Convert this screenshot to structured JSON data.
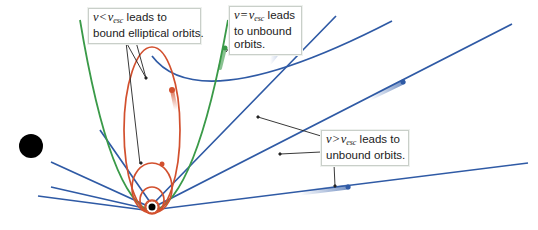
{
  "colors": {
    "ellipse": "#d2502e",
    "parabola": "#3a9a48",
    "hyperbola": "#2f5aa5",
    "planet": "#000000",
    "leader_line": "#222222",
    "callout_border": "#c9cfc9"
  },
  "callouts": {
    "bound": {
      "v": "v",
      "op": "<",
      "vsub_base": "v",
      "vsub": "esc",
      "text_line1_suffix": " leads to",
      "text_line2": "bound elliptical orbits."
    },
    "parabolic": {
      "v": "v",
      "op": "=",
      "vsub_base": "v",
      "vsub": "esc",
      "text_line1_suffix": " leads",
      "text_line2": "to unbound",
      "text_line3": "orbits."
    },
    "hyperbolic": {
      "v": "v",
      "op": ">",
      "vsub_base": "v",
      "vsub": "esc",
      "text_line1_suffix": " leads to",
      "text_line2": "unbound orbits."
    }
  },
  "bodies": {
    "central_planet": "focus with black dot at bottom center",
    "external_object": "large black disk at left"
  }
}
